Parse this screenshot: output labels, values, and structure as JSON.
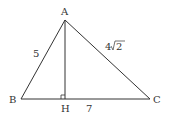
{
  "diagram": {
    "type": "triangle-with-altitude",
    "vertices": {
      "A": {
        "label": "A",
        "x": 65,
        "y": 20
      },
      "B": {
        "label": "B",
        "x": 21,
        "y": 99
      },
      "C": {
        "label": "C",
        "x": 150,
        "y": 99
      },
      "H": {
        "label": "H",
        "x": 65,
        "y": 99
      }
    },
    "side_labels": {
      "AB": "5",
      "AC_coef": "4",
      "AC_rad": "2",
      "HC": "7"
    },
    "right_angle_at": "H",
    "stroke_color": "#333333"
  }
}
